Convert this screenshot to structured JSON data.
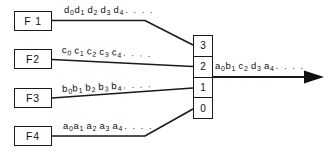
{
  "diagram": {
    "background_color": "#ffffff",
    "line_color": "#1a1a1a",
    "text_color": "#101010",
    "sources": [
      {
        "box_label": "F 1",
        "stream": {
          "symbol": "d",
          "terms": [
            "d0",
            "d1",
            "d2",
            "d3",
            "d4"
          ],
          "subscripts": [
            "0",
            "1",
            "2",
            "3",
            "4"
          ],
          "trailing": ". . . ."
        },
        "port": "3"
      },
      {
        "box_label": "F2",
        "stream": {
          "symbol": "c",
          "terms": [
            "c0",
            "c1",
            "c2",
            "c3",
            "c4"
          ],
          "subscripts": [
            "0",
            "1",
            "2",
            "3",
            "4"
          ],
          "trailing": ". . . ."
        },
        "port": "2"
      },
      {
        "box_label": "F3",
        "stream": {
          "symbol": "b",
          "terms": [
            "b0",
            "b1",
            "b2",
            "b3",
            "b4"
          ],
          "subscripts": [
            "0",
            "1",
            "2",
            "3",
            "4"
          ],
          "trailing": ". . . ."
        },
        "port": "1"
      },
      {
        "box_label": "F4",
        "stream": {
          "symbol": "a",
          "terms": [
            "a0",
            "a1",
            "a2",
            "a3",
            "a4"
          ],
          "subscripts": [
            "0",
            "1",
            "2",
            "3",
            "4"
          ],
          "trailing": ". . . ."
        },
        "port": "0"
      }
    ],
    "mux": {
      "cells": [
        "3",
        "2",
        "1",
        "0"
      ]
    },
    "output": {
      "symbols": [
        "a",
        "b",
        "c",
        "d",
        "a"
      ],
      "subscripts": [
        "0",
        "1",
        "2",
        "3",
        "4"
      ],
      "trailing": ". . . ."
    }
  }
}
